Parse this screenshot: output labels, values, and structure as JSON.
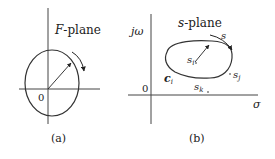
{
  "panel_a": {
    "plane_label_italic": "F",
    "plane_label_rest": "-plane",
    "origin_label": "0",
    "caption": "(a)"
  },
  "panel_b": {
    "plane_label_italic": "s",
    "plane_label_rest": "-plane",
    "y_axis_label": "jω",
    "x_axis_label": "σ",
    "origin_label": "0",
    "contour_label": "c",
    "contour_sub": "i",
    "direction_label": "s",
    "point_i": "s",
    "point_i_sub": "i",
    "point_j": "s",
    "point_j_sub": "j",
    "point_k": "s",
    "point_k_sub": "k",
    "caption": "(b)"
  },
  "colors": {
    "line": "#333333",
    "background": "#ffffff"
  }
}
